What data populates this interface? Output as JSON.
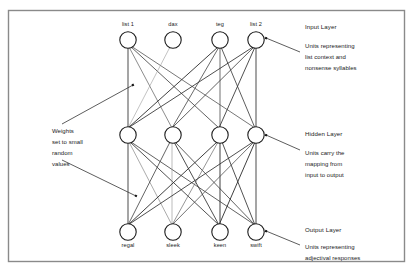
{
  "figure": {
    "border_color": "#8a8a8a",
    "background": "#ffffff",
    "node_stroke": "#1a1a1a",
    "edge_color": "#333333"
  },
  "layers": {
    "input": {
      "name": "Input Layer",
      "nodes": [
        {
          "label": "list 1"
        },
        {
          "label": "dax"
        },
        {
          "label": "teg"
        },
        {
          "label": "list 2"
        }
      ]
    },
    "hidden": {
      "name": "Hidden Layer",
      "nodes": [
        {
          "label": ""
        },
        {
          "label": ""
        },
        {
          "label": ""
        },
        {
          "label": ""
        }
      ]
    },
    "output": {
      "name": "Output Layer",
      "nodes": [
        {
          "label": "regal"
        },
        {
          "label": "sleek"
        },
        {
          "label": "keen"
        },
        {
          "label": "swift"
        }
      ]
    }
  },
  "annotations": {
    "input": {
      "title": "Input Layer",
      "lines": [
        "Units representing",
        "list context and",
        "nonsense syllables"
      ]
    },
    "hidden": {
      "title": "Hidden Layer",
      "lines": [
        "Units carry the",
        "mapping from",
        "input to output"
      ]
    },
    "output": {
      "title": "Output Layer",
      "lines": [
        "Units representing",
        "adjectival responses"
      ]
    },
    "weights": {
      "lines": [
        "Weights",
        "set to small",
        "random",
        "values"
      ]
    }
  }
}
